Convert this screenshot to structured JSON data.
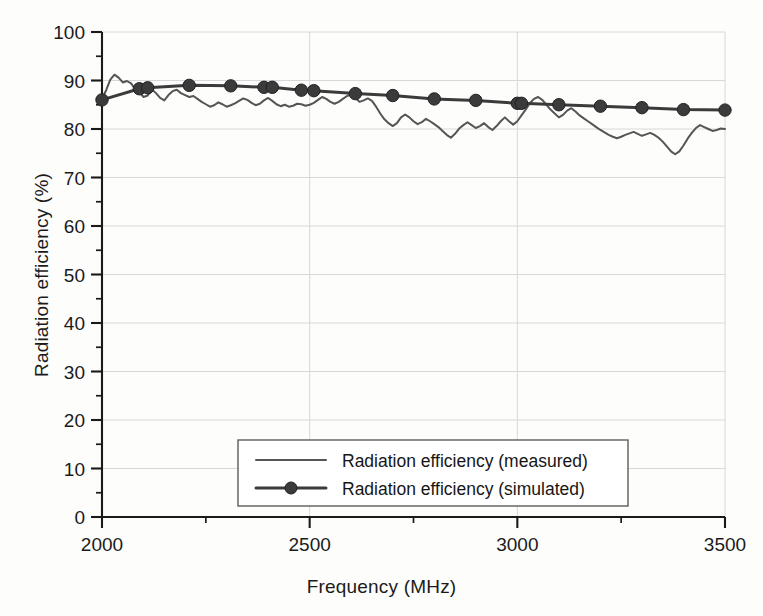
{
  "chart_data": {
    "type": "line",
    "title": "",
    "xlabel": "Frequency (MHz)",
    "ylabel": "Radiation efficiency (%)",
    "xlim": [
      2000,
      3500
    ],
    "ylim": [
      0,
      100
    ],
    "x_major_ticks": [
      2000,
      2500,
      3000,
      3500
    ],
    "x_minor_tick_interval": 250,
    "y_major_ticks": [
      0,
      10,
      20,
      30,
      40,
      50,
      60,
      70,
      80,
      90,
      100
    ],
    "y_minor_tick_interval": 5,
    "x_tick_labels": [
      "2000",
      "2500",
      "3000",
      "3500"
    ],
    "y_tick_labels": [
      "0",
      "10",
      "20",
      "30",
      "40",
      "50",
      "60",
      "70",
      "80",
      "90",
      "100"
    ],
    "grid": true,
    "grid_color": "#d8d8d8",
    "legend_position": "bottom-center",
    "series": [
      {
        "name": "Radiation efficiency (measured)",
        "style": "line",
        "color": "#555555",
        "marker": "none",
        "x": [
          2000,
          2010,
          2020,
          2030,
          2040,
          2050,
          2060,
          2070,
          2080,
          2090,
          2100,
          2110,
          2120,
          2130,
          2140,
          2150,
          2160,
          2170,
          2180,
          2190,
          2200,
          2210,
          2220,
          2230,
          2240,
          2250,
          2260,
          2270,
          2280,
          2290,
          2300,
          2310,
          2320,
          2330,
          2340,
          2350,
          2360,
          2370,
          2380,
          2390,
          2400,
          2410,
          2420,
          2430,
          2440,
          2450,
          2460,
          2470,
          2480,
          2490,
          2500,
          2510,
          2520,
          2530,
          2540,
          2550,
          2560,
          2570,
          2580,
          2590,
          2600,
          2610,
          2620,
          2630,
          2640,
          2650,
          2660,
          2670,
          2680,
          2690,
          2700,
          2710,
          2720,
          2730,
          2740,
          2750,
          2760,
          2770,
          2780,
          2790,
          2800,
          2810,
          2820,
          2830,
          2840,
          2850,
          2860,
          2870,
          2880,
          2890,
          2900,
          2910,
          2920,
          2930,
          2940,
          2950,
          2960,
          2970,
          2980,
          2990,
          3000,
          3010,
          3020,
          3030,
          3040,
          3050,
          3060,
          3070,
          3080,
          3090,
          3100,
          3110,
          3120,
          3130,
          3140,
          3150,
          3160,
          3170,
          3180,
          3190,
          3200,
          3210,
          3220,
          3230,
          3240,
          3250,
          3260,
          3270,
          3280,
          3290,
          3300,
          3310,
          3320,
          3330,
          3340,
          3350,
          3360,
          3370,
          3380,
          3390,
          3400,
          3410,
          3420,
          3430,
          3440,
          3450,
          3460,
          3470,
          3480,
          3490,
          3500
        ],
        "y": [
          86.2,
          88.0,
          90.2,
          91.2,
          90.6,
          89.6,
          89.9,
          89.4,
          88.2,
          87.6,
          86.6,
          86.9,
          88.2,
          87.4,
          86.4,
          85.9,
          87.0,
          87.8,
          88.1,
          87.4,
          87.0,
          86.6,
          86.8,
          86.2,
          85.6,
          85.1,
          84.6,
          84.9,
          85.5,
          85.1,
          84.6,
          84.9,
          85.3,
          85.8,
          86.3,
          86.0,
          85.4,
          84.9,
          85.2,
          85.9,
          86.4,
          85.8,
          85.1,
          84.7,
          85.0,
          84.6,
          84.8,
          85.2,
          85.1,
          84.8,
          85.0,
          85.4,
          86.0,
          86.6,
          86.2,
          85.6,
          85.2,
          85.6,
          86.2,
          86.8,
          87.1,
          86.4,
          85.6,
          85.9,
          86.3,
          85.8,
          84.6,
          83.2,
          82.0,
          81.2,
          80.6,
          81.2,
          82.4,
          83.0,
          82.4,
          81.6,
          81.0,
          81.4,
          82.1,
          81.6,
          81.0,
          80.4,
          79.6,
          78.8,
          78.2,
          79.0,
          80.1,
          80.8,
          81.4,
          80.8,
          80.2,
          80.6,
          81.2,
          80.4,
          79.8,
          80.6,
          81.6,
          82.4,
          81.6,
          80.9,
          81.6,
          82.8,
          84.0,
          85.3,
          86.2,
          86.6,
          86.0,
          85.0,
          84.0,
          83.2,
          82.4,
          82.9,
          83.8,
          84.3,
          83.6,
          82.8,
          82.2,
          81.6,
          81.0,
          80.4,
          79.8,
          79.3,
          78.8,
          78.4,
          78.1,
          78.4,
          78.8,
          79.1,
          79.4,
          79.0,
          78.6,
          78.9,
          79.2,
          78.8,
          78.2,
          77.4,
          76.4,
          75.4,
          74.8,
          75.4,
          76.6,
          78.0,
          79.2,
          80.2,
          80.8,
          80.4,
          80.0,
          79.6,
          79.8,
          80.1,
          80.0
        ]
      },
      {
        "name": "Radiation efficiency (simulated)",
        "style": "line-marker",
        "color": "#3b3b3b",
        "marker": "circle",
        "x": [
          2000,
          2090,
          2110,
          2210,
          2310,
          2390,
          2410,
          2480,
          2510,
          2610,
          2700,
          2800,
          2900,
          3000,
          3010,
          3100,
          3200,
          3300,
          3400,
          3500
        ],
        "y": [
          86.0,
          88.3,
          88.5,
          89.0,
          88.9,
          88.6,
          88.6,
          88.0,
          87.9,
          87.3,
          86.9,
          86.2,
          85.9,
          85.3,
          85.3,
          85.0,
          84.7,
          84.4,
          84.0,
          83.9
        ]
      }
    ]
  },
  "legend": {
    "entries": [
      {
        "label": "Radiation efficiency (measured)",
        "marker": "none"
      },
      {
        "label": "Radiation efficiency (simulated)",
        "marker": "circle"
      }
    ]
  },
  "axes": {
    "x_title": "Frequency (MHz)",
    "y_title": "Radiation efficiency (%)"
  }
}
